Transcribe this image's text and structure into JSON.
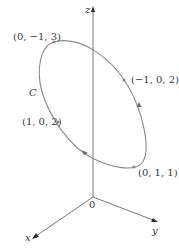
{
  "diagram": {
    "axes": {
      "x_label": "x",
      "y_label": "y",
      "z_label": "z",
      "origin_label": "0"
    },
    "curve": {
      "label": "C",
      "color": "#8a8a8a",
      "shape": "ellipse",
      "orientation_arrows": 2
    },
    "points": [
      {
        "label": "(0, −1, 3)"
      },
      {
        "label": "(−1, 0, 2)"
      },
      {
        "label": "(1, 0, 2)"
      },
      {
        "label": "(0, 1, 1)"
      }
    ]
  }
}
